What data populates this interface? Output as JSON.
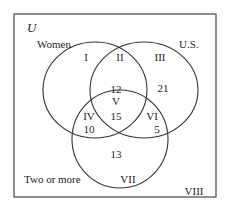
{
  "diagram": {
    "universe_label": "U",
    "sets": [
      {
        "name": "Women"
      },
      {
        "name": "U.S."
      },
      {
        "name": "Two or more"
      }
    ],
    "regions": [
      {
        "id": "I",
        "value": ""
      },
      {
        "id": "II",
        "value": ""
      },
      {
        "id": "III",
        "value": "21"
      },
      {
        "id": "IV",
        "value": "10"
      },
      {
        "id": "V",
        "value": "15"
      },
      {
        "id": "V_upper",
        "value": "12"
      },
      {
        "id": "VI",
        "value": "5"
      },
      {
        "id": "VII",
        "value": "13"
      },
      {
        "id": "VIII",
        "value": ""
      }
    ],
    "colors": {
      "stroke": "#333333",
      "text": "#222222"
    }
  }
}
